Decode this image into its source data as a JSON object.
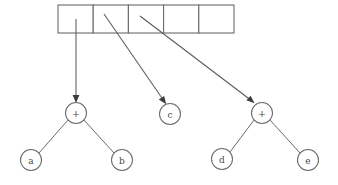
{
  "figure": {
    "background_color": "#ffffff",
    "line_color": "#6b6b6b",
    "text_color": "#4a4a4a",
    "arrow_color": "#3d3d3d"
  },
  "array": {
    "name": "pointer-array",
    "cell_count": 5,
    "left": 58,
    "top": 5,
    "right": 234,
    "bottom": 33,
    "cell_width": 35.2,
    "cells": [
      {
        "index": 0,
        "label": "",
        "x": 58.0,
        "has_pointer": true
      },
      {
        "index": 1,
        "label": "",
        "x": 93.2,
        "has_pointer": true
      },
      {
        "index": 2,
        "label": "",
        "x": 128.4,
        "has_pointer": true
      },
      {
        "index": 3,
        "label": "",
        "x": 163.6,
        "has_pointer": false
      },
      {
        "index": 4,
        "label": "",
        "x": 198.8,
        "has_pointer": false
      }
    ]
  },
  "nodes": [
    {
      "id": "plus1",
      "label": "+",
      "kind": "operator",
      "cx": 76,
      "cy": 113,
      "r": 10.5
    },
    {
      "id": "a",
      "label": "a",
      "kind": "operand",
      "cx": 31,
      "cy": 160,
      "r": 10.5
    },
    {
      "id": "b",
      "label": "b",
      "kind": "operand",
      "cx": 122,
      "cy": 160,
      "r": 10.5
    },
    {
      "id": "c",
      "label": "c",
      "kind": "operand",
      "cx": 170,
      "cy": 114,
      "r": 10.5
    },
    {
      "id": "plus2",
      "label": "+",
      "kind": "operator",
      "cx": 262,
      "cy": 113,
      "r": 10.5
    },
    {
      "id": "d",
      "label": "d",
      "kind": "operand",
      "cx": 222,
      "cy": 159,
      "r": 10.5
    },
    {
      "id": "e",
      "label": "e",
      "kind": "operand",
      "cx": 308,
      "cy": 160,
      "r": 10.5
    }
  ],
  "pointers": [
    {
      "id": "ptr0",
      "from_cell": 0,
      "to_node": "plus1",
      "x1": 76,
      "y1": 19,
      "x2": 76,
      "y2": 101
    },
    {
      "id": "ptr1",
      "from_cell": 1,
      "to_node": "c",
      "x1": 104,
      "y1": 14,
      "x2": 165,
      "y2": 103
    },
    {
      "id": "ptr2",
      "from_cell": 2,
      "to_node": "plus2",
      "x1": 140,
      "y1": 16,
      "x2": 253,
      "y2": 104
    }
  ],
  "edges": [
    {
      "id": "e-plus1-a",
      "from": "plus1",
      "to": "a",
      "x1": 68,
      "y1": 120,
      "x2": 39,
      "y2": 153
    },
    {
      "id": "e-plus1-b",
      "from": "plus1",
      "to": "b",
      "x1": 84,
      "y1": 120,
      "x2": 114,
      "y2": 153
    },
    {
      "id": "e-plus2-d",
      "from": "plus2",
      "to": "d",
      "x1": 254,
      "y1": 120,
      "x2": 230,
      "y2": 152
    },
    {
      "id": "e-plus2-e",
      "from": "plus2",
      "to": "e",
      "x1": 270,
      "y1": 120,
      "x2": 300,
      "y2": 153
    }
  ],
  "labels": {
    "plus": "+",
    "a": "a",
    "b": "b",
    "c": "c",
    "d": "d",
    "e": "e"
  }
}
